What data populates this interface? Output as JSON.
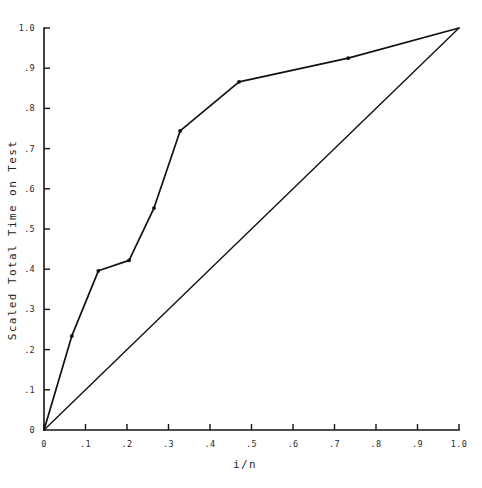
{
  "chart_data": {
    "type": "line",
    "title": "",
    "subtitle": "",
    "xlabel": "i/n",
    "ylabel": "Scaled Total Time on Test",
    "xlim": [
      0,
      1.0
    ],
    "ylim": [
      0,
      1.0
    ],
    "grid": false,
    "legend": "none",
    "xticks": [
      0,
      0.1,
      0.2,
      0.3,
      0.4,
      0.5,
      0.6,
      0.7,
      0.8,
      0.9,
      1.0
    ],
    "xtick_labels": [
      "0",
      ".1",
      ".2",
      ".3",
      ".4",
      ".5",
      ".6",
      ".7",
      ".8",
      ".9",
      "1.0"
    ],
    "yticks": [
      0,
      0.1,
      0.2,
      0.3,
      0.4,
      0.5,
      0.6,
      0.7,
      0.8,
      0.9,
      1.0
    ],
    "ytick_labels": [
      "0",
      ".1",
      ".2",
      ".3",
      ".4",
      ".5",
      ".6",
      ".7",
      ".8",
      ".9",
      "1.0"
    ],
    "series": [
      {
        "name": "Scaled TTT curve",
        "markers": true,
        "x": [
          0.0,
          0.067,
          0.131,
          0.205,
          0.265,
          0.328,
          0.47,
          0.733,
          1.0
        ],
        "y": [
          0.0,
          0.234,
          0.396,
          0.422,
          0.552,
          0.744,
          0.866,
          0.925,
          1.0
        ]
      },
      {
        "name": "Exponential reference diagonal",
        "markers": false,
        "x": [
          0.0,
          1.0
        ],
        "y": [
          0.0,
          1.0
        ]
      }
    ]
  },
  "axes": {
    "x_title": "i/n",
    "y_title": "Scaled Total Time on Test"
  },
  "colors": {
    "line": "#121212",
    "axis": "#141414",
    "marker": "#0d0d0d",
    "background": "#ffffff"
  }
}
